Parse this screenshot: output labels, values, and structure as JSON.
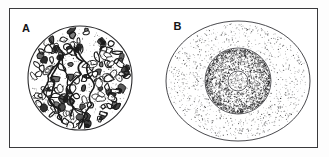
{
  "figure": {
    "type": "two-panel scientific line illustration",
    "frame": {
      "border_color": "#3a3a3c",
      "background_color": "#ffffff",
      "page_background": "#fdfdfd"
    },
    "panels": [
      {
        "id": "a",
        "label": "A",
        "subject": "cellular tissue section",
        "rendering": "ink stipple and outline blobs",
        "shape": "circle",
        "description": "circular field densely filled with irregular cell-like blobs and branching strands",
        "ink_color": "#1a1a1a",
        "outline_color": "#2b2b2d",
        "blob_count": 150,
        "strand_count": 5
      },
      {
        "id": "b",
        "label": "B",
        "subject": "idealized cell with nucleus and nucleolus",
        "rendering": "stipple dots with thin outlines",
        "shape": "concentric ellipses",
        "description": "outer cell membrane ellipse, stippled cytoplasm, round nucleus, small central nucleolus",
        "ink_color": "#1e1e20",
        "outline_color": "#35353a",
        "layers": [
          {
            "name": "cell-membrane",
            "rx": 72,
            "ry": 60,
            "stipple_density": "light"
          },
          {
            "name": "nucleus",
            "rx": 33,
            "ry": 33,
            "stipple_density": "heavy"
          },
          {
            "name": "nucleolus",
            "rx": 10,
            "ry": 10,
            "stipple_density": "light"
          }
        ]
      }
    ]
  }
}
